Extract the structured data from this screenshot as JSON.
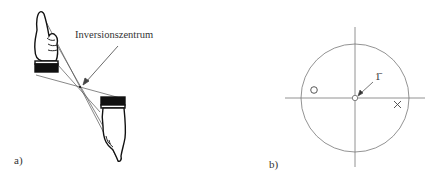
{
  "panel_a": {
    "label": "a)",
    "annotation": "Inversionszentrum"
  },
  "panel_b": {
    "label": "b)",
    "symbol_label": "1̄",
    "markers": [
      "circle-marker",
      "cross-marker"
    ]
  },
  "colors": {
    "line": "#555555",
    "ink": "#111111",
    "background": "#ffffff"
  }
}
